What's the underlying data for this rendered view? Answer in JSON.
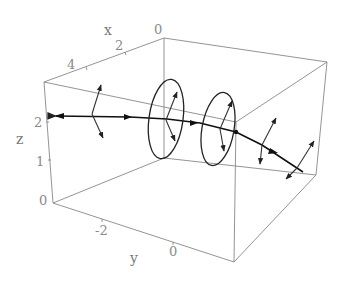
{
  "figure": {
    "type": "3D box plot of space curve with field vectors and loops",
    "axes": {
      "x": {
        "label": "x",
        "ticks": [
          "0",
          "2",
          "4"
        ]
      },
      "y": {
        "label": "y",
        "ticks": [
          "-2",
          "0"
        ]
      },
      "z": {
        "label": "z",
        "ticks": [
          "0",
          "1",
          "2"
        ]
      }
    },
    "elements": {
      "curve": "thick directed curve through box with arrowheads",
      "loops": 2,
      "vector_triads": 4
    }
  }
}
